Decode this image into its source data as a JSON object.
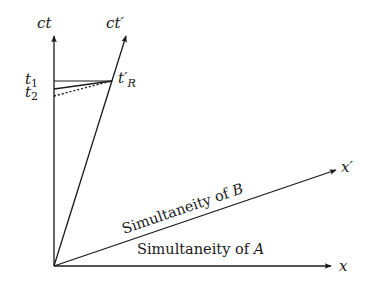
{
  "diagram": {
    "colors": {
      "ink": "#1a1a1a",
      "background": "#ffffff"
    },
    "origin": {
      "x": 54,
      "y": 266
    },
    "axes": {
      "ct": {
        "label": "ct",
        "tip": {
          "x": 54,
          "y": 35
        },
        "label_pos": {
          "x": 39,
          "y": 27
        }
      },
      "ct_prime": {
        "label": "ct′",
        "tip": {
          "x": 126,
          "y": 35
        },
        "label_pos": {
          "x": 107,
          "y": 27
        }
      },
      "x": {
        "label": "x",
        "tip": {
          "x": 332,
          "y": 266
        },
        "label_pos": {
          "x": 340,
          "y": 270
        }
      },
      "x_prime": {
        "label": "x′",
        "tip": {
          "x": 337,
          "y": 169
        },
        "label_pos": {
          "x": 341,
          "y": 170
        }
      }
    },
    "events": {
      "t1": {
        "label": "t₁",
        "label_sub": "1",
        "axis_y": 81,
        "label_pos": {
          "x": 26,
          "y": 83
        }
      },
      "t2": {
        "label": "t₂",
        "label_sub": "2",
        "axis_y": 89,
        "label_pos": {
          "x": 26,
          "y": 97
        }
      },
      "t3_dotted_y": 96,
      "t_prime_R": {
        "label": "t′",
        "label_sub": "R",
        "point": {
          "x": 112,
          "y": 81
        },
        "label_pos": {
          "x": 119,
          "y": 83
        }
      }
    },
    "annotations": {
      "simultaneity_A": {
        "text": "Simultaneity of ",
        "var": "A",
        "pos": {
          "x": 137,
          "y": 254
        }
      },
      "simultaneity_B": {
        "text": "Simultaneity of ",
        "var": "B",
        "pos": {
          "x": 124,
          "y": 234
        },
        "angle": -19
      }
    }
  }
}
